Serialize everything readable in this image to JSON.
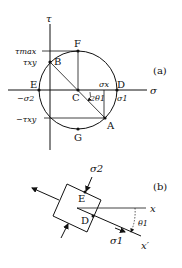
{
  "panel_a": {
    "tag": "(a)",
    "axis_tau": "τ",
    "axis_sigma": "σ",
    "points": {
      "F": "F",
      "B": "B",
      "E": "E",
      "C": "C",
      "D": "D",
      "A": "A",
      "G": "G"
    },
    "labels": {
      "tau_max": "τmax",
      "tau_xy": "τxy",
      "neg_tau_xy": "−τxy",
      "neg_sigma2": "−σ2",
      "sigma_x": "σx",
      "sigma1": "σ1",
      "angle": "2θ1"
    }
  },
  "panel_b": {
    "tag": "(b)",
    "points": {
      "E": "E",
      "D": "D"
    },
    "labels": {
      "sigma2": "σ2",
      "sigma1": "σ1",
      "x": "x",
      "x_prime": "x′",
      "theta": "θ1"
    }
  }
}
